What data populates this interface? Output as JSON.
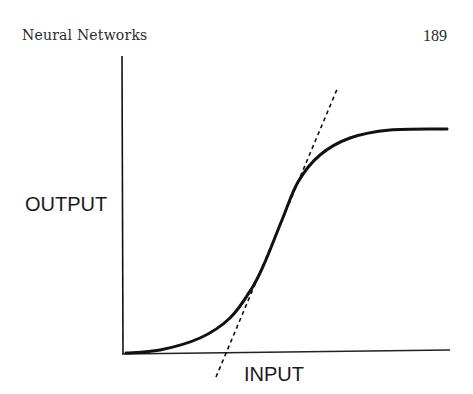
{
  "page": {
    "running_head": "Neural Networks",
    "page_number": "189"
  },
  "chart_data": {
    "type": "line",
    "title": "",
    "xlabel": "INPUT",
    "ylabel": "OUTPUT",
    "grid": false,
    "legend": null,
    "ticks": {
      "x": [],
      "y": []
    },
    "series": [
      {
        "name": "sigmoid",
        "style": "solid",
        "color": "#111111",
        "points_px": [
          [
            126,
            353
          ],
          [
            160,
            350
          ],
          [
            200,
            338
          ],
          [
            230,
            318
          ],
          [
            252,
            288
          ],
          [
            265,
            262
          ],
          [
            282,
            220
          ],
          [
            298,
            182
          ],
          [
            320,
            155
          ],
          [
            350,
            138
          ],
          [
            390,
            130
          ],
          [
            447,
            129
          ]
        ]
      },
      {
        "name": "tangent",
        "style": "dashed",
        "color": "#111111",
        "points_px": [
          [
            216,
            377
          ],
          [
            338,
            87
          ]
        ]
      }
    ],
    "axes": {
      "y_axis": {
        "x": 122,
        "y_top": 56,
        "y_bottom": 354
      },
      "x_axis": {
        "y_left": 354,
        "x_left": 122,
        "x_right": 450,
        "y_right": 350
      }
    }
  },
  "colors": {
    "ink": "#111111",
    "background": "#ffffff"
  }
}
